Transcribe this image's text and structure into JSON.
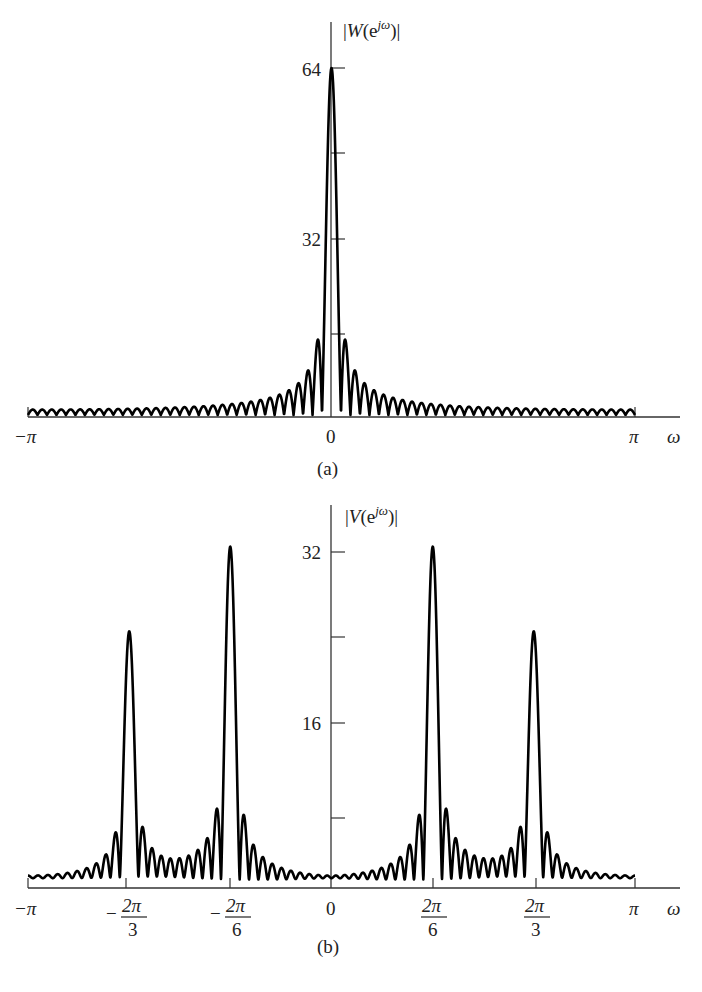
{
  "chart_data": [
    {
      "type": "line",
      "panel_label": "(a)",
      "title": "|W(e^{jω})|",
      "ylabel": "|W(e^{jω})|",
      "xlabel": "ω",
      "x_ticks": [
        {
          "value": -3.14159,
          "label": "−π"
        },
        {
          "value": 0,
          "label": "0"
        },
        {
          "value": 3.14159,
          "label": "π"
        }
      ],
      "y_ticks": [
        {
          "value": 16,
          "label": ""
        },
        {
          "value": 32,
          "label": "32"
        },
        {
          "value": 48,
          "label": ""
        },
        {
          "value": 64,
          "label": "64"
        }
      ],
      "ylim": [
        0,
        72
      ],
      "xlim": [
        -3.14159,
        3.14159
      ],
      "grid": false,
      "description": "Magnitude of DTFT of 64-point rectangular window (Dirichlet kernel), main lobe peak 64 at ω=0, side lobes decaying",
      "window_length": 64,
      "peaks": [
        {
          "omega": 0,
          "magnitude": 64
        }
      ]
    },
    {
      "type": "line",
      "panel_label": "(b)",
      "title": "|V(e^{jω})|",
      "ylabel": "|V(e^{jω})|",
      "xlabel": "ω",
      "x_ticks": [
        {
          "value": -3.14159,
          "label": "−π"
        },
        {
          "value": -2.0944,
          "label": "−2π/3"
        },
        {
          "value": -1.0472,
          "label": "−2π/6"
        },
        {
          "value": 0,
          "label": "0"
        },
        {
          "value": 1.0472,
          "label": "2π/6"
        },
        {
          "value": 2.0944,
          "label": "2π/3"
        },
        {
          "value": 3.14159,
          "label": "π"
        }
      ],
      "y_ticks": [
        {
          "value": 8,
          "label": ""
        },
        {
          "value": 16,
          "label": "16"
        },
        {
          "value": 24,
          "label": ""
        },
        {
          "value": 32,
          "label": "32"
        }
      ],
      "ylim": [
        0,
        36
      ],
      "xlim": [
        -3.14159,
        3.14159
      ],
      "grid": false,
      "description": "Windowed DTFT of sum of two cosines: peaks at ±2π/6 (≈32) and ±2π/3 (≈24)",
      "window_length": 64,
      "peaks": [
        {
          "omega": -2.0944,
          "magnitude": 24
        },
        {
          "omega": -1.0472,
          "magnitude": 32
        },
        {
          "omega": 1.0472,
          "magnitude": 32
        },
        {
          "omega": 2.0944,
          "magnitude": 24
        }
      ]
    }
  ],
  "labels": {
    "a": {
      "ylabel_prefix": "|",
      "ylabel_W": "W",
      "ylabel_rest": "(e",
      "ylabel_sup": "jω",
      "ylabel_close": ")|",
      "y64": "64",
      "y32": "32",
      "x_neg_pi": "−π",
      "x_zero": "0",
      "x_pi": "π",
      "x_omega": "ω",
      "panel": "(a)"
    },
    "b": {
      "ylabel_prefix": "|",
      "ylabel_V": "V",
      "ylabel_rest": "(e",
      "ylabel_sup": "jω",
      "ylabel_close": ")|",
      "y32": "32",
      "y16": "16",
      "x_neg_pi": "−π",
      "x_neg_2pi3_num": "2π",
      "x_neg_2pi3_den": "3",
      "x_neg_2pi6_num": "2π",
      "x_neg_2pi6_den": "6",
      "minus": "−",
      "x_zero": "0",
      "x_2pi6_num": "2π",
      "x_2pi6_den": "6",
      "x_2pi3_num": "2π",
      "x_2pi3_den": "3",
      "x_pi": "π",
      "x_omega": "ω",
      "panel": "(b)"
    }
  }
}
